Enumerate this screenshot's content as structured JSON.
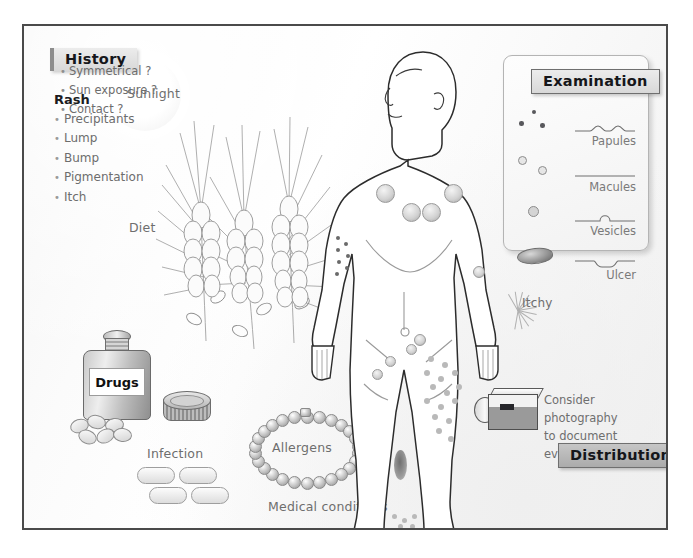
{
  "poster": {
    "background_color": "#fdfdfd",
    "border_color": "#4a4a4a"
  },
  "history": {
    "header": "History",
    "subheading": "Rash",
    "items": [
      "Precipitants",
      "Lump",
      "Bump",
      "Pigmentation",
      "Itch"
    ],
    "sunlight_label": "Sunlight",
    "diet_label": "Diet",
    "drugs_label": "Drugs",
    "infection_label": "Infection",
    "allergens_label": "Allergens",
    "medical_conditions_label": "Medical conditions"
  },
  "examination": {
    "header": "Examination",
    "rows": [
      {
        "name": "Papules",
        "profile": "two-raised-bumps"
      },
      {
        "name": "Macules",
        "profile": "flat-line"
      },
      {
        "name": "Vesicles",
        "profile": "single-dome-blister"
      },
      {
        "name": "Ulcer",
        "profile": "depression-below-line"
      }
    ]
  },
  "distribution": {
    "header": "Distribution",
    "items": [
      "Symmetrical ?",
      "Sun exposure ?",
      "Contact ?"
    ]
  },
  "photography": {
    "line1": "Consider photography",
    "line2": "to document evidence"
  },
  "body_figure": {
    "itchy_label": "Itchy"
  },
  "colors": {
    "text_gray": "#6e6e6e",
    "text_dark": "#15161a",
    "chip_fill": "#e4e4e4",
    "chip_fill_dark": "#b8b8b8",
    "line_gray": "#8c8c8c"
  }
}
